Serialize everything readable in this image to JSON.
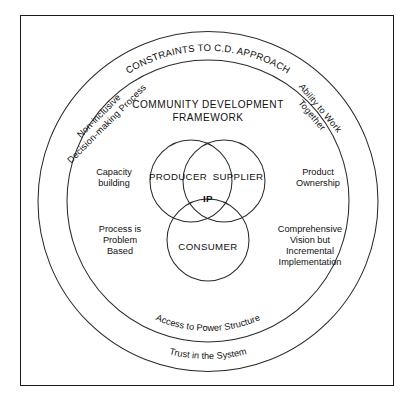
{
  "diagram": {
    "title_line1": "COMMUNITY DEVELOPMENT",
    "title_line2": "FRAMEWORK",
    "outer_ring_label": "CONSTRAINTS TO C.D. APPROACH",
    "outer_ring_bottom_label": "Trust in the System",
    "inner_ring_bottom_label": "Access to Power Structure",
    "outer_left_label_line1": "Non-inclusive",
    "outer_left_label_line2": "Decision-making Process",
    "outer_right_label_line1": "Ability to Work",
    "outer_right_label_line2": "Together",
    "inner_notes": {
      "left_upper": {
        "line1": "Capacity",
        "line2": "building"
      },
      "right_upper": {
        "line1": "Product",
        "line2": "Ownership"
      },
      "left_lower": {
        "line1": "Process is",
        "line2": "Problem",
        "line3": "Based"
      },
      "right_lower": {
        "line1": "Comprehensive",
        "line2": "Vision but",
        "line3": "Incremental",
        "line4": "Implementation"
      }
    },
    "venn": {
      "producer": "PRODUCER",
      "supplier": "SUPPLIER",
      "consumer": "CONSUMER",
      "intersection": "IP"
    },
    "colors": {
      "stroke": "#2b2b2b",
      "frame": "#1a1a1a",
      "text": "#111111",
      "background": "#ffffff"
    }
  }
}
